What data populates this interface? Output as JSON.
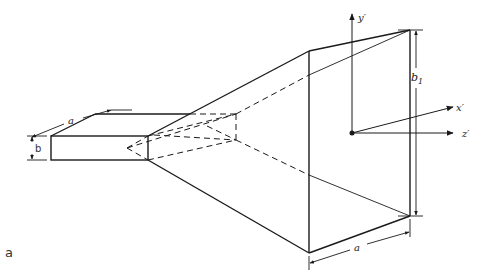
{
  "figure": {
    "panel_label": "a",
    "labels": {
      "waveguide_width": "a",
      "waveguide_height": "b",
      "aperture_height": "b",
      "aperture_height_sub": "1",
      "aperture_width": "a",
      "axis_y": "y′",
      "axis_x": "x′",
      "axis_z": "z′"
    },
    "colors": {
      "line": "#1a1a1a",
      "background": "#ffffff"
    }
  }
}
